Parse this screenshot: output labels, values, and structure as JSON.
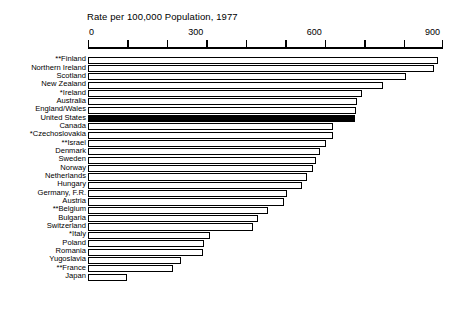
{
  "chart_data": {
    "type": "bar",
    "orientation": "horizontal",
    "title": "Rate per 100,000 Population, 1977",
    "xlabel": "",
    "ylabel": "",
    "xlim": [
      0,
      900
    ],
    "grid": false,
    "legend": "none",
    "tick_values": [
      0,
      100,
      200,
      300,
      400,
      500,
      600,
      700,
      800,
      900
    ],
    "tick_labels": [
      {
        "value": 0,
        "label": "0"
      },
      {
        "value": 300,
        "label": "300"
      },
      {
        "value": 600,
        "label": "600"
      },
      {
        "value": 900,
        "label": "900"
      }
    ],
    "highlight_category": "United States",
    "categories": [
      "**Finland",
      "Northern Ireland",
      "Scotland",
      "New Zealand",
      "*Ireland",
      "Australia",
      "England/Wales",
      "United States",
      "Canada",
      "*Czechoslovakia",
      "**Israel",
      "Denmark",
      "Sweden",
      "Norway",
      "Netherlands",
      "Hungary",
      "Germany, F.R.",
      "Austria",
      "**Belgium",
      "Bulgaria",
      "Switzerland",
      "*Italy",
      "Poland",
      "Romania",
      "Yugoslavia",
      "**France",
      "Japan"
    ],
    "values": [
      888,
      877,
      806,
      748,
      695,
      682,
      679,
      677,
      621,
      621,
      604,
      588,
      578,
      570,
      555,
      542,
      504,
      497,
      456,
      431,
      418,
      309,
      294,
      291,
      236,
      215,
      99
    ]
  },
  "axis": {
    "labels": [
      "0",
      "300",
      "600",
      "900"
    ]
  }
}
